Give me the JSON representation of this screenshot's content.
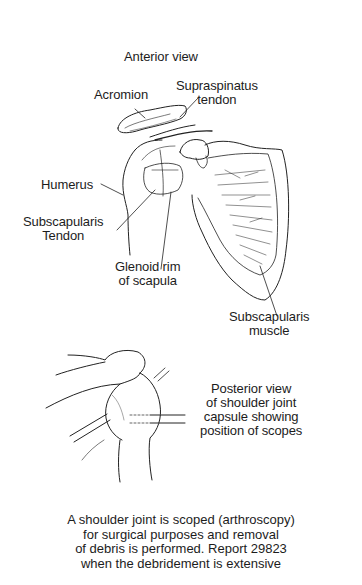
{
  "figure": {
    "anterior": {
      "title": "Anterior view",
      "labels": {
        "acromion": "Acromion",
        "supraspinatus": [
          "Supraspinatus",
          "tendon"
        ],
        "humerus": "Humerus",
        "subscapularis_tendon": [
          "Subscapularis",
          "Tendon"
        ],
        "glenoid_rim": [
          "Glenoid rim",
          "of scapula"
        ],
        "subscapularis_muscle": [
          "Subscapularis",
          "muscle"
        ]
      }
    },
    "posterior": {
      "description": [
        "Posterior view",
        "of shoulder joint",
        "capsule showing",
        "position of scopes"
      ]
    },
    "caption": [
      "A shoulder joint is scoped (arthroscopy)",
      "for surgical purposes and removal",
      "of debris is performed. Report 29823",
      "when the debridement is extensive"
    ],
    "colors": {
      "ink": "#1c1c1c",
      "background": "#ffffff"
    }
  }
}
